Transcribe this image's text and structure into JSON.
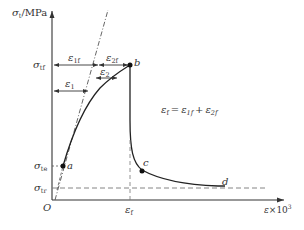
{
  "diagram": {
    "type": "stress-strain curve",
    "y_axis_label": {
      "symbol": "σ",
      "sub": "t",
      "unit": "/MPa"
    },
    "x_axis_label": {
      "symbol": "ε",
      "suffix": "×10",
      "sup": "3"
    },
    "origin_label": "O",
    "y_ticks": [
      {
        "symbol": "σ",
        "sub": "tf"
      },
      {
        "symbol": "σ",
        "sub": "te"
      },
      {
        "symbol": "σ",
        "sub": "tr"
      }
    ],
    "x_ticks": [
      {
        "symbol": "ε",
        "sub": "f"
      }
    ],
    "points": [
      {
        "label": "a"
      },
      {
        "label": "b"
      },
      {
        "label": "c"
      },
      {
        "label": "d"
      }
    ],
    "dimension_labels": {
      "e1f": {
        "symbol": "ε",
        "sub": "1f"
      },
      "e2f": {
        "symbol": "ε",
        "sub": "2f"
      },
      "e1": {
        "symbol": "ε",
        "sub": "1"
      },
      "e2": {
        "symbol": "ε",
        "sub": "2"
      }
    },
    "equation": {
      "lhs": {
        "symbol": "ε",
        "sub": "f"
      },
      "eq": "=",
      "t1": {
        "symbol": "ε",
        "sub": "1f"
      },
      "plus": "+",
      "t2": {
        "symbol": "ε",
        "sub": "2f"
      }
    }
  }
}
